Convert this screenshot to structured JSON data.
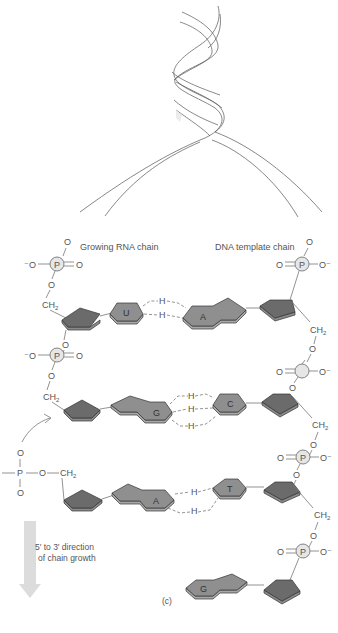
{
  "labels": {
    "rna_chain": "Growing RNA chain",
    "dna_chain": "DNA template chain",
    "direction_line1": "5′ to 3′ direction",
    "direction_line2": "of chain growth",
    "panel": "(c)"
  },
  "atoms": {
    "P": "P",
    "O": "O",
    "O_minus": "O⁻",
    "minus_O": "⁻O",
    "CH2": "CH",
    "sub2": "2",
    "H": "H"
  },
  "base_pairs": [
    {
      "rna": "U",
      "dna": "A",
      "h_bonds": 2
    },
    {
      "rna": "G",
      "dna": "C",
      "h_bonds": 3
    },
    {
      "rna": "A",
      "dna": "T",
      "h_bonds": 2
    },
    {
      "rna": null,
      "dna": "G",
      "h_bonds": 0
    }
  ],
  "colors": {
    "sugar": "#6b6b6b",
    "base": "#8f8f8f",
    "phosphate": "#e6e6e6",
    "arrow": "#d9d9d9",
    "line": "#777777"
  }
}
